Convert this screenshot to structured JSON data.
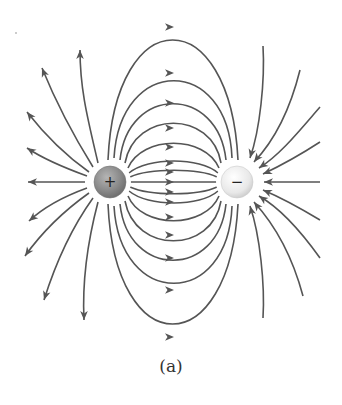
{
  "figure": {
    "caption": "(a)",
    "colors": {
      "line": "#555555",
      "positive_charge_fill": "#8a8a8a",
      "negative_charge_fill": "#ededed",
      "background": "#ffffff"
    }
  },
  "charges": [
    {
      "id": "positive",
      "sign": "+",
      "cx": 110,
      "cy": 182,
      "r": 16
    },
    {
      "id": "negative",
      "sign": "−",
      "cx": 237,
      "cy": 182,
      "r": 16
    }
  ],
  "field_lines": {
    "between": [
      {
        "d": "M108,160 C115,0 230,0 238,160",
        "arrow": [
          170,
          27
        ]
      },
      {
        "d": "M114,158 C120,55 228,55 232,158",
        "arrow": [
          170,
          73
        ]
      },
      {
        "d": "M120,160 C128,85 218,85 226,160",
        "arrow": [
          170,
          103
        ]
      },
      {
        "d": "M125,163 C135,110 212,110 221,163",
        "arrow": [
          170,
          128
        ]
      },
      {
        "d": "M128,168 C142,135 205,135 219,168",
        "arrow": [
          170,
          147
        ]
      },
      {
        "d": "M129,173 C148,157 200,157 218,173",
        "arrow": [
          170,
          163
        ]
      },
      {
        "d": "M130,177 C150,168 198,168 217,177",
        "arrow": [
          170,
          172
        ]
      },
      {
        "d": "M130,182 L217,182",
        "arrow": [
          170,
          182
        ]
      },
      {
        "d": "M130,187 C150,196 198,196 217,187",
        "arrow": [
          170,
          192
        ]
      },
      {
        "d": "M129,191 C148,207 200,207 218,191",
        "arrow": [
          170,
          202
        ]
      },
      {
        "d": "M128,196 C142,229 205,229 219,196",
        "arrow": [
          170,
          217
        ]
      },
      {
        "d": "M125,201 C135,254 212,254 221,201",
        "arrow": [
          170,
          235
        ]
      },
      {
        "d": "M120,204 C128,279 218,279 226,204",
        "arrow": [
          170,
          258
        ]
      },
      {
        "d": "M114,206 C120,309 228,309 232,206",
        "arrow": [
          170,
          290
        ]
      },
      {
        "d": "M108,204 C115,364 230,364 238,204",
        "arrow": [
          170,
          337
        ]
      }
    ],
    "outgoing_left": [
      {
        "d": "M98,163 C88,120 80,90 80,50",
        "tip": [
          80,
          50
        ],
        "angle": -90
      },
      {
        "d": "M93,167 C70,130 55,100 42,68",
        "tip": [
          42,
          68
        ],
        "angle": -112
      },
      {
        "d": "M89,172 C65,155 45,135 27,112",
        "tip": [
          27,
          112
        ],
        "angle": -128
      },
      {
        "d": "M87,176 C65,168 45,160 27,148",
        "tip": [
          27,
          148
        ],
        "angle": -147
      },
      {
        "d": "M85,182 L28,182",
        "tip": [
          28,
          182
        ],
        "angle": 180
      },
      {
        "d": "M87,188 C65,196 45,206 29,221",
        "tip": [
          29,
          221
        ],
        "angle": 140
      },
      {
        "d": "M89,193 C65,210 45,228 25,256",
        "tip": [
          25,
          256
        ],
        "angle": 125
      },
      {
        "d": "M93,198 C70,230 55,265 44,300",
        "tip": [
          44,
          300
        ],
        "angle": 108
      },
      {
        "d": "M98,202 C88,240 82,280 84,320",
        "tip": [
          84,
          320
        ],
        "angle": 90
      }
    ],
    "incoming_right": [
      {
        "d": "M263,46 C265,80 260,130 250,158",
        "tip": [
          250,
          158
        ],
        "angle": 105
      },
      {
        "d": "M300,70 C290,110 275,140 254,162",
        "tip": [
          254,
          162
        ],
        "angle": 128
      },
      {
        "d": "M320,107 C300,130 280,155 259,168",
        "tip": [
          259,
          168
        ],
        "angle": 145
      },
      {
        "d": "M320,142 C300,155 282,165 263,174",
        "tip": [
          263,
          174
        ],
        "angle": 157
      },
      {
        "d": "M320,182 L264,182",
        "tip": [
          264,
          182
        ],
        "angle": 180
      },
      {
        "d": "M320,220 C300,208 282,198 263,190",
        "tip": [
          263,
          190
        ],
        "angle": -157
      },
      {
        "d": "M320,258 C300,230 280,208 259,196",
        "tip": [
          259,
          196
        ],
        "angle": -145
      },
      {
        "d": "M303,296 C292,255 275,225 254,202",
        "tip": [
          254,
          202
        ],
        "angle": -128
      },
      {
        "d": "M263,318 C265,285 260,235 250,206",
        "tip": [
          250,
          206
        ],
        "angle": -105
      }
    ]
  }
}
